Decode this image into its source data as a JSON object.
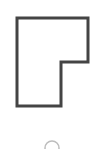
{
  "canvas": {
    "width": 111,
    "height": 149,
    "background": "#ffffff"
  },
  "shape": {
    "type": "polygon-outline",
    "description": "L-shaped outline with notch at lower-right",
    "points": [
      [
        17,
        18
      ],
      [
        88,
        18
      ],
      [
        88,
        62
      ],
      [
        61,
        62
      ],
      [
        61,
        106
      ],
      [
        17,
        106
      ]
    ],
    "stroke": "#444444",
    "stroke_width": 3,
    "fill": "#ffffff"
  },
  "spinner": {
    "icon": "loading-arc-icon",
    "cx": 52,
    "cy": 148,
    "r": 7,
    "stroke": "#bdbdbd",
    "stroke_width": 1.5
  }
}
